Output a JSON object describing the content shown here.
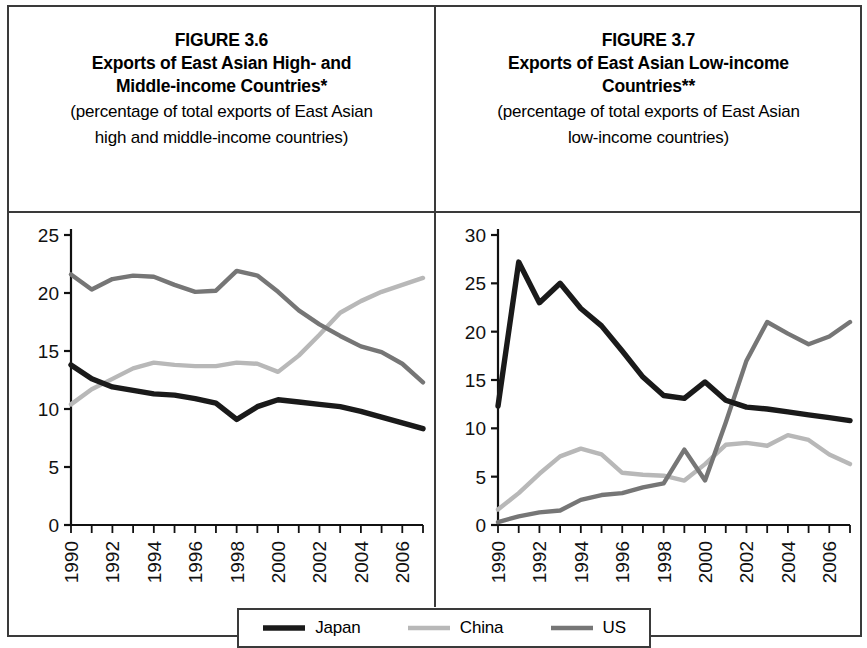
{
  "figure": {
    "legend": {
      "items": [
        {
          "label": "Japan",
          "color": "#1a1a1a",
          "width": 5.5
        },
        {
          "label": "China",
          "color": "#b8b8b8",
          "width": 4.5
        },
        {
          "label": "US",
          "color": "#767676",
          "width": 4.5
        }
      ]
    }
  },
  "panels": [
    {
      "id": "figure-3-6",
      "title_line1": "FIGURE 3.6",
      "title_line2": "Exports of East Asian High- and",
      "title_line3": "Middle-income Countries*",
      "subtitle_line1": "(percentage of total exports of East Asian",
      "subtitle_line2": "high and middle-income countries)"
    },
    {
      "id": "figure-3-7",
      "title_line1": "FIGURE 3.7",
      "title_line2": "Exports of East Asian Low-income",
      "title_line3": "Countries**",
      "subtitle_line1": "(percentage of total exports of East Asian",
      "subtitle_line2": "low-income countries)"
    }
  ],
  "chart_data": [
    {
      "type": "line",
      "id": "figure-3-6",
      "title": "FIGURE 3.6 Exports of East Asian High- and Middle-income Countries*",
      "subtitle": "(percentage of total exports of East Asian high and middle-income countries)",
      "xlabel": "",
      "ylabel": "",
      "ylim": [
        0,
        25
      ],
      "yticks": [
        0,
        5,
        10,
        15,
        20,
        25
      ],
      "xlim": [
        1990,
        2007
      ],
      "x": [
        1990,
        1991,
        1992,
        1993,
        1994,
        1995,
        1996,
        1997,
        1998,
        1999,
        2000,
        2001,
        2002,
        2003,
        2004,
        2005,
        2006,
        2007
      ],
      "xticks": [
        1990,
        1992,
        1994,
        1996,
        1998,
        2000,
        2002,
        2004,
        2006
      ],
      "xticklabels": [
        "1990",
        "1992",
        "1994",
        "1996",
        "1998",
        "2000",
        "2002",
        "2004",
        "2006"
      ],
      "grid": false,
      "legend_position": "bottom",
      "series": [
        {
          "name": "Japan",
          "color": "#1a1a1a",
          "values": [
            13.8,
            12.6,
            11.9,
            11.6,
            11.3,
            11.2,
            10.9,
            10.5,
            9.1,
            10.2,
            10.8,
            10.6,
            10.4,
            10.2,
            9.8,
            9.3,
            8.8,
            8.3
          ]
        },
        {
          "name": "China",
          "color": "#b8b8b8",
          "values": [
            10.4,
            11.7,
            12.6,
            13.5,
            14.0,
            13.8,
            13.7,
            13.7,
            14.0,
            13.9,
            13.2,
            14.6,
            16.4,
            18.3,
            19.3,
            20.1,
            20.7,
            21.3
          ]
        },
        {
          "name": "US",
          "color": "#767676",
          "values": [
            21.6,
            20.3,
            21.2,
            21.5,
            21.4,
            20.7,
            20.1,
            20.2,
            21.9,
            21.5,
            20.1,
            18.5,
            17.3,
            16.3,
            15.4,
            14.9,
            13.9,
            12.3
          ]
        }
      ]
    },
    {
      "type": "line",
      "id": "figure-3-7",
      "title": "FIGURE 3.7 Exports of East Asian Low-income Countries**",
      "subtitle": "(percentage of total exports of East Asian low-income countries)",
      "xlabel": "",
      "ylabel": "",
      "ylim": [
        0,
        30
      ],
      "yticks": [
        0,
        5,
        10,
        15,
        20,
        25,
        30
      ],
      "xlim": [
        1990,
        2007
      ],
      "x": [
        1990,
        1991,
        1992,
        1993,
        1994,
        1995,
        1996,
        1997,
        1998,
        1999,
        2000,
        2001,
        2002,
        2003,
        2004,
        2005,
        2006,
        2007
      ],
      "xticks": [
        1990,
        1992,
        1994,
        1996,
        1998,
        2000,
        2002,
        2004,
        2006
      ],
      "xticklabels": [
        "1990",
        "1992",
        "1994",
        "1996",
        "1998",
        "2000",
        "2002",
        "2004",
        "2006"
      ],
      "grid": false,
      "legend_position": "bottom",
      "series": [
        {
          "name": "Japan",
          "color": "#1a1a1a",
          "values": [
            12.3,
            27.2,
            23.0,
            25.0,
            22.4,
            20.6,
            18.0,
            15.3,
            13.4,
            13.1,
            14.8,
            12.9,
            12.2,
            12.0,
            11.7,
            11.4,
            11.1,
            10.8
          ]
        },
        {
          "name": "China",
          "color": "#b8b8b8",
          "values": [
            1.6,
            3.3,
            5.3,
            7.1,
            7.9,
            7.3,
            5.4,
            5.2,
            5.1,
            4.6,
            6.3,
            8.3,
            8.5,
            8.2,
            9.3,
            8.8,
            7.3,
            6.3
          ]
        },
        {
          "name": "US",
          "color": "#767676",
          "values": [
            0.3,
            0.9,
            1.3,
            1.5,
            2.6,
            3.1,
            3.3,
            3.9,
            4.3,
            7.8,
            4.6,
            10.6,
            17.0,
            21.0,
            19.8,
            18.7,
            19.5,
            21.0
          ]
        }
      ]
    }
  ]
}
